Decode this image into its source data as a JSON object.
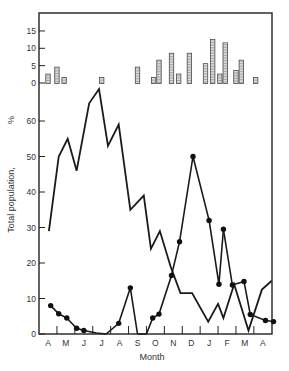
{
  "chart_data": [
    {
      "type": "bar",
      "title": "",
      "panel": "top inset",
      "ylabel": "",
      "yticks": [
        0,
        5,
        10,
        15
      ],
      "ylim": [
        0,
        18
      ],
      "x_positions_month_index": [
        0.0,
        0.5,
        0.9,
        3.0,
        5.0,
        5.9,
        6.2,
        6.9,
        7.3,
        7.9,
        8.8,
        9.2,
        9.6,
        9.9,
        10.5,
        10.8,
        11.6
      ],
      "values": [
        2,
        4,
        1,
        1,
        4,
        1,
        6,
        8,
        2,
        8,
        5,
        12,
        2,
        11,
        3,
        6,
        1
      ]
    },
    {
      "type": "line",
      "title": "",
      "xlabel": "Month",
      "ylabel": "Total population, %",
      "yticks": [
        0,
        10,
        20,
        30,
        40,
        50,
        60
      ],
      "ylim": [
        0,
        70
      ],
      "categories": [
        "A",
        "M",
        "J",
        "J",
        "A",
        "S",
        "O",
        "N",
        "D",
        "J",
        "F",
        "M",
        "A"
      ],
      "grid": false,
      "series": [
        {
          "name": "Total population (solid line, no markers)",
          "x": [
            0.05,
            0.6,
            1.1,
            1.6,
            2.3,
            2.85,
            3.35,
            3.95,
            4.6,
            5.35,
            5.75,
            6.25,
            6.85,
            7.4,
            8.05,
            8.95,
            9.5,
            9.8,
            10.4,
            11.2,
            11.95,
            12.5
          ],
          "values": [
            29,
            50,
            55,
            46,
            65,
            69,
            53,
            59,
            35,
            39,
            24,
            29,
            19,
            11.5,
            11.5,
            3.5,
            8.5,
            4.5,
            14,
            1,
            12.5,
            15
          ]
        },
        {
          "name": "Population (solid line with filled circle markers)",
          "x": [
            0.15,
            0.6,
            1.05,
            1.6,
            2.0,
            2.7,
            3.25,
            3.95,
            4.6,
            5.0,
            5.5,
            5.85,
            6.2,
            6.9,
            7.35,
            8.1,
            9.0,
            9.55,
            9.8,
            10.3,
            10.95,
            11.3,
            12.15,
            12.6
          ],
          "values": [
            8,
            5.7,
            4.5,
            1.6,
            1.0,
            0.3,
            0,
            3,
            13,
            0,
            0,
            4.5,
            5.6,
            16.5,
            26,
            50,
            32,
            14,
            29.5,
            13.8,
            14.8,
            5.5,
            3.8,
            3.5
          ]
        }
      ]
    }
  ],
  "axes": {
    "top_ticks": [
      "0",
      "5",
      "10",
      "15"
    ],
    "main_ticks": [
      "0",
      "10",
      "20",
      "30",
      "40",
      "50",
      "60"
    ],
    "months": [
      "A",
      "M",
      "J",
      "J",
      "A",
      "S",
      "O",
      "N",
      "D",
      "J",
      "F",
      "M",
      "A"
    ],
    "xlabel": "Month",
    "ylabel": "Total population,",
    "ylabel_unit": "%"
  }
}
